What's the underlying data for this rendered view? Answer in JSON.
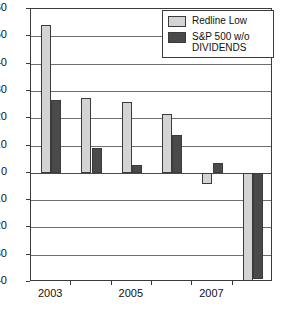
{
  "chart_data": {
    "type": "bar",
    "title": "",
    "xlabel": "",
    "ylabel": "",
    "categories": [
      "2003",
      "2004",
      "2005",
      "2006",
      "2007",
      "2008"
    ],
    "visible_tick_labels": [
      "2003",
      "",
      "2005",
      "",
      "2007",
      ""
    ],
    "series": [
      {
        "name": "Redline Low",
        "color": "#d4d4d4",
        "values": [
          54,
          27.5,
          26,
          21.5,
          -4,
          -39.5
        ]
      },
      {
        "name": "S&P 500 w/o\nDIVIDENDS",
        "color": "#4a4a4a",
        "values": [
          26.5,
          9,
          3,
          13.7,
          3.5,
          -39
        ]
      }
    ],
    "ylim": [
      -40,
      60
    ],
    "yticks": [
      60,
      50,
      40,
      30,
      20,
      10,
      0,
      -10,
      -20,
      -30,
      -40
    ],
    "ytick_labels": [
      "60",
      "50",
      "40",
      "30",
      "20",
      "10",
      "0",
      "−10",
      "−20",
      "−30",
      "−40"
    ],
    "grid": true,
    "grid_axis": "y",
    "legend_position": "top-right",
    "border_color": "#3b3b3b",
    "background": "#ffffff"
  },
  "legend": {
    "entries": [
      {
        "label": "Redline Low",
        "swatch": "legend-swatch-light"
      },
      {
        "label": "S&P 500 w/o\nDIVIDENDS",
        "swatch": "legend-swatch-dark"
      }
    ]
  }
}
